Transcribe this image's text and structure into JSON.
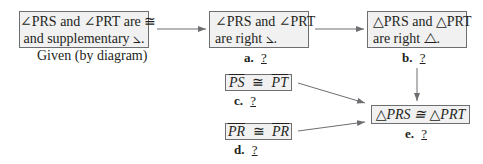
{
  "boxes": {
    "given": {
      "line1": "∠PRS and ∠PRT are ≅",
      "line2": "and supplementary ⦣.",
      "reason": "Given (by diagram)"
    },
    "a": {
      "line1": "∠PRS and ∠PRT",
      "line2": "are right ⦣.",
      "letter": "a.",
      "blank": " ? "
    },
    "b": {
      "line1": "△PRS and △PRT",
      "line2": "are right ⧍.",
      "letter": "b.",
      "blank": " ? "
    },
    "c": {
      "left": "PS",
      "op": "≅",
      "right": "PT",
      "letter": "c.",
      "blank": " ? "
    },
    "d": {
      "left": "PR",
      "op": "≅",
      "right": "PR",
      "letter": "d.",
      "blank": " ? "
    },
    "e": {
      "statement": "△PRS ≅ △PRT",
      "letter": "e.",
      "blank": " ? "
    }
  },
  "colors": {
    "box_fill": "#f1f1f2",
    "box_border": "#6d6e71",
    "arrow": "#6d6e71",
    "text": "#231f20"
  }
}
